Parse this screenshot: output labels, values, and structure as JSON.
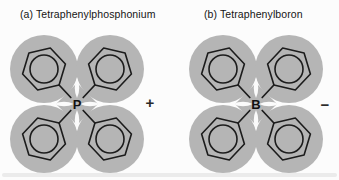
{
  "figure": {
    "panels": [
      {
        "title": "(a) Tetraphenylphosphonium",
        "central_atom": "P",
        "charge": "+",
        "phenyl_ring_count": 4
      },
      {
        "title": "(b) Tetraphenylboron",
        "central_atom": "B",
        "charge": "−",
        "phenyl_ring_count": 4
      }
    ],
    "colors": {
      "lobe_gray": "#b5b5b5",
      "ring_stroke": "#1c1c1c",
      "background": "#fcfcfc",
      "text": "#151515"
    }
  }
}
